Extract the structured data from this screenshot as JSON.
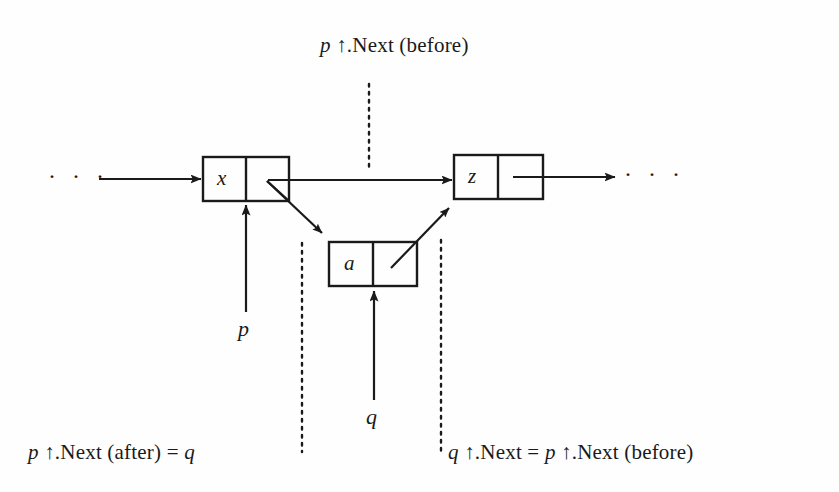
{
  "diagram": {
    "title_label": "p ↑.Next (before)",
    "nodes": [
      {
        "id": "node-x",
        "value": "x"
      },
      {
        "id": "node-z",
        "value": "z"
      },
      {
        "id": "node-a",
        "value": "a"
      }
    ],
    "pointer_labels": [
      {
        "id": "pointer-p",
        "text": "p"
      },
      {
        "id": "pointer-q",
        "text": "q"
      }
    ],
    "annotations": [
      {
        "id": "annotation-top",
        "text": "p ↑.Next (before)"
      },
      {
        "id": "annotation-bottom-left",
        "text": "p ↑.Next (after) = q"
      },
      {
        "id": "annotation-bottom-right",
        "text": "q ↑.Next = p ↑.Next (before)"
      }
    ],
    "ellipsis_left": "· · ·",
    "ellipsis_right": "· · ·",
    "colors": {
      "ink": "#1a1a1a",
      "paper": "#fefefe"
    }
  }
}
